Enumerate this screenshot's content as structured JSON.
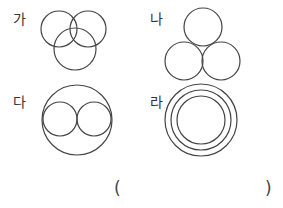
{
  "figures": [
    {
      "label": "가",
      "description": "three overlapping circles",
      "circles": [
        {
          "cx": 59,
          "cy": 29,
          "r": 18
        },
        {
          "cx": 88,
          "cy": 29,
          "r": 18
        },
        {
          "cx": 75,
          "cy": 49,
          "r": 21
        }
      ]
    },
    {
      "label": "나",
      "description": "three mutually tangent circles",
      "circles": [
        {
          "cx": 203,
          "cy": 27,
          "r": 19
        },
        {
          "cx": 184,
          "cy": 61,
          "r": 19
        },
        {
          "cx": 221,
          "cy": 61,
          "r": 19
        }
      ]
    },
    {
      "label": "다",
      "description": "two tangent circles inside a larger circle",
      "circles": [
        {
          "cx": 77,
          "cy": 120,
          "r": 35
        },
        {
          "cx": 60,
          "cy": 119,
          "r": 17
        },
        {
          "cx": 94,
          "cy": 119,
          "r": 17
        }
      ]
    },
    {
      "label": "라",
      "description": "three concentric circles",
      "circles": [
        {
          "cx": 201,
          "cy": 120,
          "r": 36
        },
        {
          "cx": 201,
          "cy": 120,
          "r": 30
        },
        {
          "cx": 201,
          "cy": 120,
          "r": 24
        }
      ]
    }
  ],
  "answer": {
    "open": "(",
    "close": ")",
    "value": ""
  },
  "colors": {
    "stroke": "#444444",
    "background": "#ffffff"
  }
}
